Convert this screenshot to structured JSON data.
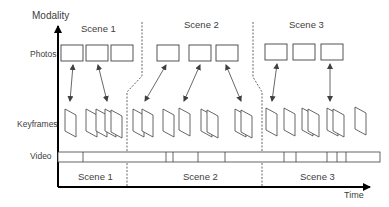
{
  "axes": {
    "y_label": "Modality",
    "x_label": "Time"
  },
  "rows": {
    "photos": "Photos",
    "keyframes": "Keyframes",
    "video": "Video"
  },
  "scenes_top": [
    "Scene 1",
    "Scene 2",
    "Scene 3"
  ],
  "scenes_bottom": [
    "Scene 1",
    "Scene 2",
    "Scene 3"
  ],
  "colors": {
    "stroke": "#404040",
    "axis": "#000000",
    "text": "#404040"
  }
}
